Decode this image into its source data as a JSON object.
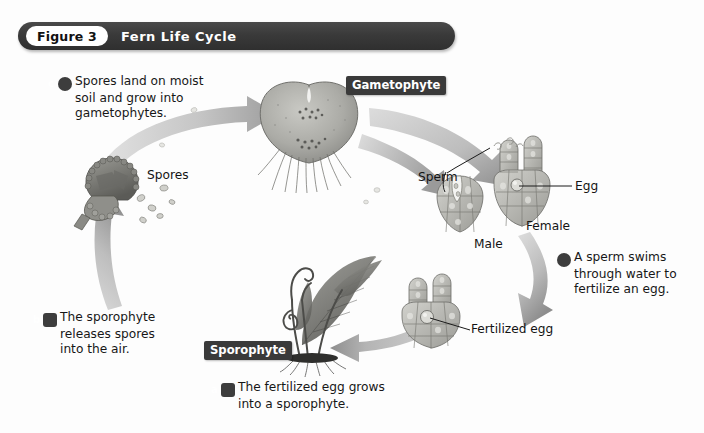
{
  "figure": {
    "number_label": "Figure 3",
    "title": "Fern Life Cycle"
  },
  "steps": [
    {
      "key": "a",
      "marker": "a",
      "marker_shape": "rounded-square",
      "line1": "The fertilized egg grows",
      "line2": "into a sporophyte.",
      "line3": ""
    },
    {
      "key": "b",
      "marker": "b",
      "marker_shape": "rounded-square",
      "line1": "The sporophyte",
      "line2": "releases spores",
      "line3": "into the air."
    },
    {
      "key": "c",
      "marker": "c",
      "marker_shape": "circle",
      "line1": "Spores land on moist",
      "line2": "soil and grow into",
      "line3": "gametophytes."
    },
    {
      "key": "d",
      "marker": "d",
      "marker_shape": "circle",
      "line1": "A sperm swims",
      "line2": "through water to",
      "line3": "fertilize an egg."
    }
  ],
  "stage_labels": {
    "gametophyte": "Gametophyte",
    "sporophyte": "Sporophyte"
  },
  "part_labels": {
    "spores": "Spores",
    "sperm": "Sperm",
    "egg": "Egg",
    "male": "Male",
    "female": "Female",
    "fertilized_egg": "Fertilized egg"
  },
  "colors": {
    "bar_dark": "#3a3a3a",
    "bar_pill": "#ffffff",
    "label_dark": "#3a3a3a",
    "arrow_gray": "#b9b9b9",
    "arrow_gray_dark": "#8f8f8f",
    "art_gray": "#a9a9a9",
    "art_gray_dark": "#6f6f6f",
    "text": "#171717",
    "page_bg": "#ffffff"
  },
  "icons": {
    "gametophyte": "heart-shaped-prothallus-icon",
    "sporophyte": "fern-plant-icon",
    "sporangium": "spore-capsule-icon",
    "spore": "spore-dot-icon",
    "antheridium": "male-gametophyte-icon",
    "archegonium": "female-gametophyte-icon",
    "zygote": "fertilized-egg-icon",
    "sperm": "sperm-cell-icon",
    "arrow": "curved-arrow-icon"
  }
}
